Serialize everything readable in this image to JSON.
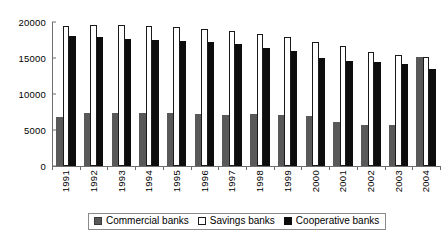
{
  "chart_data": {
    "type": "bar",
    "title": "",
    "subtitle": "",
    "xlabel": "",
    "ylabel": "",
    "ylim": [
      0,
      20000
    ],
    "yticks": [
      0,
      5000,
      10000,
      15000,
      20000
    ],
    "ytick_labels": [
      "0",
      "5000",
      "10000",
      "15000",
      "20000"
    ],
    "grid": false,
    "legend_position": "bottom",
    "categories": [
      "1991",
      "1992",
      "1993",
      "1994",
      "1995",
      "1996",
      "1997",
      "1998",
      "1999",
      "2000",
      "2001",
      "2002",
      "2003",
      "2004"
    ],
    "series": [
      {
        "name": "Commercial banks",
        "color": "#595959",
        "values": [
          6800,
          7400,
          7400,
          7400,
          7300,
          7200,
          7100,
          7200,
          7100,
          6900,
          6100,
          5700,
          5700,
          15100
        ]
      },
      {
        "name": "Savings banks",
        "color": "#ffffff",
        "values": [
          19500,
          19600,
          19600,
          19400,
          19300,
          19000,
          18800,
          18400,
          17900,
          17200,
          16600,
          15900,
          15400,
          15200
        ]
      },
      {
        "name": "Cooperative banks",
        "color": "#0d0d0d",
        "values": [
          18000,
          17900,
          17700,
          17500,
          17400,
          17200,
          17000,
          16400,
          16000,
          15000,
          14600,
          14400,
          14100,
          13500
        ]
      }
    ]
  },
  "legend": {
    "items": [
      {
        "label": "Commercial banks",
        "swatch": "commercial"
      },
      {
        "label": "Savings banks",
        "swatch": "savings"
      },
      {
        "label": "Cooperative banks",
        "swatch": "cooperative"
      }
    ]
  }
}
